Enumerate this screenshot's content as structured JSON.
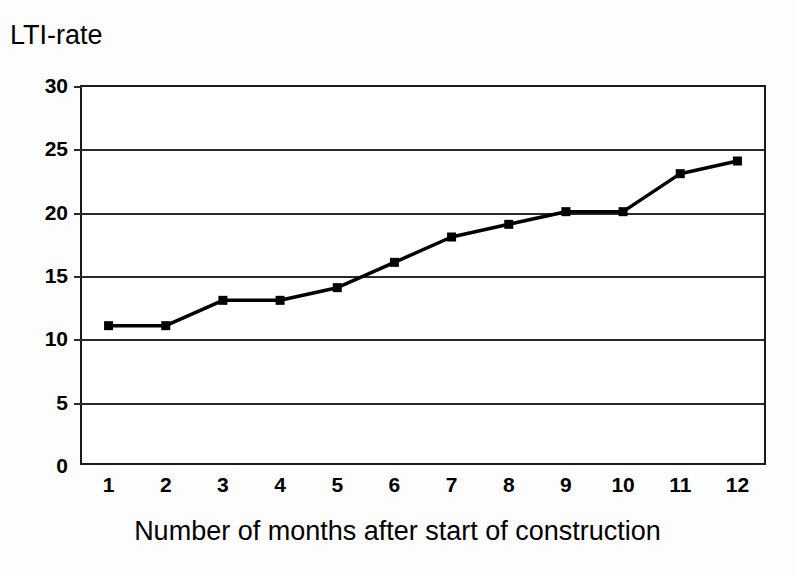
{
  "chart_data": {
    "type": "line",
    "title": "",
    "ylabel": "LTI-rate",
    "xlabel": "Number of months after start of construction",
    "categories": [
      "1",
      "2",
      "3",
      "4",
      "5",
      "6",
      "7",
      "8",
      "9",
      "10",
      "11",
      "12"
    ],
    "x": [
      1,
      2,
      3,
      4,
      5,
      6,
      7,
      8,
      9,
      10,
      11,
      12
    ],
    "values": [
      11,
      11,
      13,
      13,
      14,
      16,
      18,
      19,
      20,
      20,
      23,
      24
    ],
    "series": [
      {
        "name": "LTI-rate",
        "values": [
          11,
          11,
          13,
          13,
          14,
          16,
          18,
          19,
          20,
          20,
          23,
          24
        ]
      }
    ],
    "ylim": [
      0,
      30
    ],
    "yticks": [
      0,
      5,
      10,
      15,
      20,
      25,
      30
    ],
    "ytick_labels": [
      "0",
      "5",
      "10",
      "15",
      "20",
      "25",
      "30"
    ],
    "xlim": [
      0.5,
      12.5
    ],
    "grid": "horizontal",
    "legend": "none",
    "marker": "filled-square",
    "line_color": "#000000",
    "marker_color": "#000000",
    "grid_color": "#2b2b2b",
    "axis_color": "#1a1a1a",
    "background_color": "#ffffff"
  },
  "figure": {
    "y_axis_title": "LTI-rate",
    "x_axis_title": "Number of months after start of construction"
  }
}
